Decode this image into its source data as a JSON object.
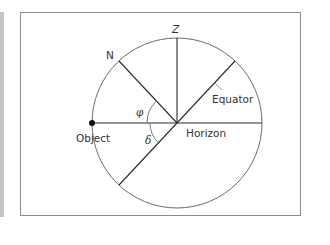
{
  "diagram": {
    "labels": {
      "zenith": "Z",
      "north": "N",
      "equator": "Equator",
      "horizon": "Horizon",
      "object": "Object",
      "phi": "φ",
      "delta": "δ"
    },
    "geometry": {
      "center": [
        177,
        123
      ],
      "radius": 85,
      "zenith_angle_deg": 90,
      "north_angle_deg": 133,
      "equator_angle_deg": 47
    },
    "colors": {
      "line": "#2a2a2a",
      "circle": "#6b6b6b",
      "frame": "#8a8a8a",
      "side_bar": "#c4c4c4",
      "leader": "#9a9a9a"
    }
  }
}
